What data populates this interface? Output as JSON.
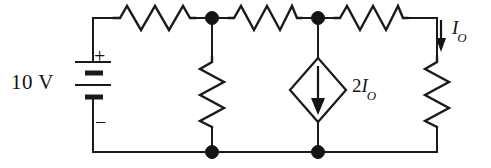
{
  "figure": {
    "name": "dc-circuit-with-dependent-current-source",
    "background_color": "#ffffff",
    "line_color": "#1a1a1a",
    "width": 491,
    "height": 168
  },
  "labels": {
    "source_value": "10 V",
    "plus_sign": "+",
    "minus_sign": "−",
    "output_current_symbol": "I",
    "output_current_subscript": "O",
    "dependent_source_coefficient": "2",
    "dependent_source_symbol": "I",
    "dependent_source_subscript": "O"
  },
  "components": {
    "voltage_source": {
      "type": "battery",
      "value": "10 V",
      "polarity_top": "+",
      "polarity_bottom": "−",
      "plate_count": 4,
      "position": {
        "x": 93,
        "y_top": 62,
        "y_bottom": 108
      }
    },
    "resistors": [
      {
        "name": "resistor-top-left",
        "orientation": "horizontal",
        "x1": 113,
        "x2": 196,
        "y": 18
      },
      {
        "name": "resistor-top-middle",
        "orientation": "horizontal",
        "x1": 228,
        "x2": 302,
        "y": 18
      },
      {
        "name": "resistor-top-right",
        "orientation": "horizontal",
        "x1": 334,
        "x2": 408,
        "y": 18
      },
      {
        "name": "resistor-shunt-left",
        "orientation": "vertical",
        "x": 212,
        "y1": 56,
        "y2": 128
      },
      {
        "name": "resistor-shunt-right",
        "orientation": "vertical",
        "x": 437,
        "y1": 56,
        "y2": 128
      }
    ],
    "dependent_current_source": {
      "name": "dependent-current-source",
      "shape": "diamond",
      "label": "2I_O",
      "arrow_direction": "down",
      "center": {
        "x": 318,
        "y": 90
      },
      "half_width": 28,
      "half_height": 32
    },
    "current_arrow": {
      "name": "output-current-arrow",
      "label": "I_O",
      "direction": "down",
      "x": 441,
      "y1": 22,
      "y2": 50
    },
    "nodes": [
      {
        "name": "node-top-left",
        "x": 212,
        "y": 18
      },
      {
        "name": "node-top-middle",
        "x": 318,
        "y": 18
      },
      {
        "name": "node-bottom-left",
        "x": 212,
        "y": 152
      },
      {
        "name": "node-bottom-middle",
        "x": 318,
        "y": 152
      }
    ],
    "wires": {
      "top_rail_y": 18,
      "bottom_rail_y": 152,
      "left_rail_x": 93,
      "right_rail_x": 437
    }
  }
}
